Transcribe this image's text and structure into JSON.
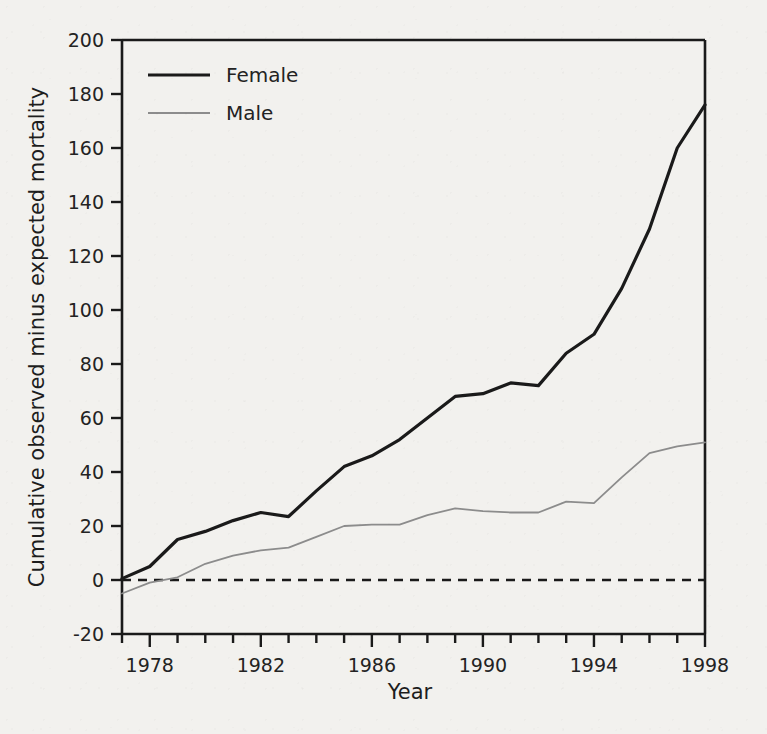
{
  "figure": {
    "background_color": "#f2f1ee",
    "axis_color": "#1a1a1a"
  },
  "chart_data": {
    "type": "line",
    "title": "",
    "xlabel": "Year",
    "ylabel": "Cumulative observed minus expected mortality",
    "xlim": [
      1977,
      1998
    ],
    "ylim": [
      -20,
      200
    ],
    "grid": false,
    "legend_position": "top-left",
    "x_tick_values": [
      1977,
      1978,
      1979,
      1980,
      1981,
      1982,
      1983,
      1984,
      1985,
      1986,
      1987,
      1988,
      1989,
      1990,
      1991,
      1992,
      1993,
      1994,
      1995,
      1996,
      1997,
      1998
    ],
    "x_tick_labels": [
      "1978",
      "1982",
      "1986",
      "1990",
      "1994",
      "1998"
    ],
    "x_labeled_values": [
      1978,
      1982,
      1986,
      1990,
      1994,
      1998
    ],
    "y_tick_values": [
      -20,
      0,
      20,
      40,
      60,
      80,
      100,
      120,
      140,
      160,
      180,
      200
    ],
    "y_tick_labels": [
      "-20",
      "0",
      "20",
      "40",
      "60",
      "80",
      "100",
      "120",
      "140",
      "160",
      "180",
      "200"
    ],
    "x": [
      1977,
      1978,
      1979,
      1980,
      1981,
      1982,
      1983,
      1984,
      1985,
      1986,
      1987,
      1988,
      1989,
      1990,
      1991,
      1992,
      1993,
      1994,
      1995,
      1996,
      1997,
      1998
    ],
    "series": [
      {
        "name": "Female",
        "color": "#1a1a1a",
        "line_width": 3.2,
        "values": [
          0.5,
          5,
          15,
          18,
          22,
          25,
          23.5,
          33,
          42,
          46,
          52,
          60,
          68,
          69,
          73,
          72,
          84,
          91,
          108,
          130,
          160,
          176
        ]
      },
      {
        "name": "Male",
        "color": "#8c8c8c",
        "line_width": 1.8,
        "values": [
          -5,
          -1,
          1,
          6,
          9,
          11,
          12,
          16,
          20,
          20.5,
          20.5,
          24,
          26.5,
          25.5,
          25,
          25,
          29,
          28.5,
          38,
          47,
          49.5,
          51
        ]
      }
    ],
    "reference_line": {
      "name": "zero-line",
      "y": 0,
      "style": "dashed",
      "color": "#1a1a1a"
    }
  },
  "legend": {
    "entries": [
      {
        "label": "Female",
        "color": "#1a1a1a",
        "line_width": 3.2
      },
      {
        "label": "Male",
        "color": "#8c8c8c",
        "line_width": 1.8
      }
    ]
  }
}
